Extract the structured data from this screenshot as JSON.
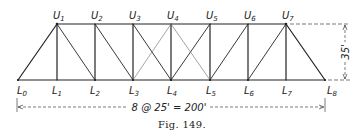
{
  "figure": {
    "caption": "Fig. 149.",
    "type": "truss-diagram",
    "panels": 8,
    "panel_length": "25'",
    "span_label": "8 @ 25' = 200'",
    "height_label": "35'",
    "top_nodes": [
      {
        "name": "U",
        "sub": "1",
        "x": 57
      },
      {
        "name": "U",
        "sub": "2",
        "x": 95
      },
      {
        "name": "U",
        "sub": "3",
        "x": 133
      },
      {
        "name": "U",
        "sub": "4",
        "x": 171
      },
      {
        "name": "U",
        "sub": "5",
        "x": 210
      },
      {
        "name": "U",
        "sub": "6",
        "x": 248
      },
      {
        "name": "U",
        "sub": "7",
        "x": 286
      }
    ],
    "bottom_nodes": [
      {
        "name": "L",
        "sub": "0",
        "x": 18
      },
      {
        "name": "L",
        "sub": "1",
        "x": 57
      },
      {
        "name": "L",
        "sub": "2",
        "x": 95
      },
      {
        "name": "L",
        "sub": "3",
        "x": 133
      },
      {
        "name": "L",
        "sub": "4",
        "x": 171
      },
      {
        "name": "L",
        "sub": "5",
        "x": 210
      },
      {
        "name": "L",
        "sub": "6",
        "x": 248
      },
      {
        "name": "L",
        "sub": "7",
        "x": 286
      },
      {
        "name": "L",
        "sub": "8",
        "x": 325
      }
    ],
    "members": {
      "top_chord": [
        "U1-U7"
      ],
      "bottom_chord": [
        "L0-L8"
      ],
      "end_posts": [
        "L0-U1",
        "U7-L8"
      ],
      "verticals": [
        "U1-L1",
        "U2-L2",
        "U3-L3",
        "U4-L4",
        "U5-L5",
        "U6-L6",
        "U7-L7"
      ],
      "diagonals_main": [
        "U1-L2",
        "U2-L3",
        "U3-L4",
        "L4-U5",
        "L5-U6",
        "L6-U7"
      ],
      "diagonals_counter": [
        "L3-U4",
        "U4-L5"
      ]
    }
  }
}
